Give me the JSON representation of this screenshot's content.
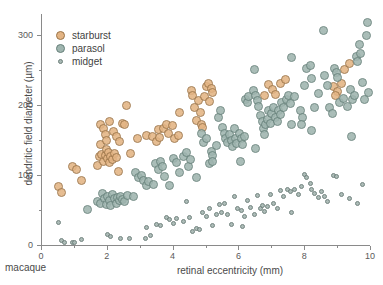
{
  "chart_data": {
    "type": "scatter",
    "title": "",
    "xlabel": "retinal eccentricity (mm)",
    "ylabel": "dendritic field diameter (µm)",
    "corner_label": "macaque",
    "xlim": [
      0,
      10
    ],
    "ylim": [
      0,
      330
    ],
    "xticks": [
      0,
      2,
      4,
      6,
      8,
      10
    ],
    "xticklabels": [
      "0",
      "2",
      "4",
      "6",
      "8",
      "10"
    ],
    "xticks_minor": [
      1,
      3,
      5,
      7,
      9
    ],
    "yticks": [
      0,
      100,
      200,
      300
    ],
    "yticklabels": [
      "0",
      "100",
      "200",
      "300"
    ],
    "yticks_minor": [
      50,
      150,
      250
    ],
    "grid": false,
    "legend_position": "upper left",
    "colors": {
      "starburst_fill": "#e3b484",
      "starburst_edge": "#9a7448",
      "parasol_fill": "#9fb5af",
      "parasol_edge": "#66807a",
      "midget_fill": "#a8b8b4",
      "midget_edge": "#6c7f7a",
      "axis": "#8a8a8a",
      "text": "#4a4a4a"
    },
    "marker_sizes": {
      "starburst": 9,
      "parasol": 9,
      "midget": 5
    },
    "series": [
      {
        "name": "starburst",
        "marker_size": 9,
        "points": [
          [
            0.52,
            83
          ],
          [
            0.62,
            75
          ],
          [
            0.95,
            112
          ],
          [
            1.08,
            108
          ],
          [
            1.22,
            92
          ],
          [
            1.72,
            113
          ],
          [
            1.78,
            126
          ],
          [
            1.8,
            143
          ],
          [
            1.85,
            130
          ],
          [
            1.9,
            120
          ],
          [
            1.95,
            128
          ],
          [
            1.98,
            136
          ],
          [
            2.02,
            124
          ],
          [
            2.05,
            132
          ],
          [
            2.08,
            118
          ],
          [
            2.12,
            127
          ],
          [
            2.18,
            122
          ],
          [
            2.22,
            131
          ],
          [
            2.28,
            125
          ],
          [
            2.35,
            105
          ],
          [
            1.82,
            172
          ],
          [
            1.9,
            166
          ],
          [
            1.95,
            158
          ],
          [
            2.0,
            150
          ],
          [
            2.08,
            176
          ],
          [
            2.2,
            162
          ],
          [
            2.3,
            155
          ],
          [
            2.38,
            148
          ],
          [
            2.48,
            173
          ],
          [
            2.55,
            172
          ],
          [
            2.6,
            199
          ],
          [
            2.72,
            131
          ],
          [
            2.92,
            152
          ],
          [
            3.22,
            157
          ],
          [
            3.38,
            155
          ],
          [
            3.5,
            148
          ],
          [
            3.58,
            165
          ],
          [
            3.6,
            153
          ],
          [
            3.72,
            166
          ],
          [
            3.82,
            172
          ],
          [
            3.88,
            160
          ],
          [
            4.0,
            171
          ],
          [
            4.05,
            152
          ],
          [
            4.18,
            157
          ],
          [
            4.22,
            190
          ],
          [
            4.58,
            221
          ],
          [
            4.62,
            213
          ],
          [
            4.68,
            196
          ],
          [
            4.72,
            178
          ],
          [
            4.8,
            206
          ],
          [
            4.85,
            190
          ],
          [
            4.88,
            172
          ],
          [
            4.92,
            168
          ],
          [
            4.98,
            212
          ],
          [
            5.02,
            226
          ],
          [
            5.08,
            231
          ],
          [
            5.12,
            205
          ],
          [
            5.18,
            224
          ],
          [
            5.22,
            218
          ],
          [
            6.78,
            213
          ],
          [
            6.92,
            230
          ],
          [
            7.05,
            222
          ],
          [
            7.12,
            215
          ],
          [
            7.28,
            231
          ],
          [
            7.42,
            237
          ],
          [
            8.88,
            226
          ],
          [
            9.02,
            219
          ],
          [
            9.12,
            231
          ],
          [
            9.22,
            251
          ],
          [
            9.38,
            259
          ],
          [
            8.95,
            214
          ]
        ]
      },
      {
        "name": "parasol",
        "marker_size": 9,
        "points": [
          [
            1.42,
            51
          ],
          [
            1.72,
            62
          ],
          [
            1.8,
            60
          ],
          [
            1.88,
            73
          ],
          [
            1.92,
            66
          ],
          [
            1.98,
            58
          ],
          [
            2.02,
            70
          ],
          [
            2.08,
            64
          ],
          [
            2.12,
            57
          ],
          [
            2.18,
            72
          ],
          [
            2.22,
            66
          ],
          [
            2.28,
            60
          ],
          [
            2.32,
            68
          ],
          [
            2.38,
            63
          ],
          [
            2.42,
            70
          ],
          [
            2.48,
            65
          ],
          [
            2.55,
            62
          ],
          [
            2.62,
            71
          ],
          [
            2.82,
            70
          ],
          [
            2.88,
            104
          ],
          [
            2.95,
            96
          ],
          [
            3.05,
            100
          ],
          [
            3.12,
            92
          ],
          [
            3.22,
            85
          ],
          [
            3.28,
            91
          ],
          [
            3.42,
            86
          ],
          [
            3.48,
            116
          ],
          [
            3.58,
            108
          ],
          [
            3.62,
            120
          ],
          [
            3.68,
            112
          ],
          [
            3.75,
            98
          ],
          [
            3.92,
            85
          ],
          [
            4.02,
            124
          ],
          [
            4.12,
            118
          ],
          [
            4.22,
            104
          ],
          [
            4.32,
            127
          ],
          [
            4.42,
            132
          ],
          [
            4.48,
            112
          ],
          [
            4.55,
            122
          ],
          [
            4.72,
            97
          ],
          [
            4.88,
            160
          ],
          [
            4.95,
            147
          ],
          [
            5.02,
            152
          ],
          [
            5.12,
            116
          ],
          [
            5.18,
            133
          ],
          [
            5.22,
            128
          ],
          [
            5.32,
            142
          ],
          [
            5.38,
            182
          ],
          [
            5.45,
            192
          ],
          [
            5.52,
            168
          ],
          [
            5.58,
            160
          ],
          [
            5.62,
            152
          ],
          [
            5.68,
            146
          ],
          [
            5.72,
            158
          ],
          [
            5.78,
            150
          ],
          [
            5.82,
            141
          ],
          [
            5.88,
            166
          ],
          [
            5.92,
            152
          ],
          [
            5.95,
            145
          ],
          [
            6.02,
            160
          ],
          [
            6.08,
            152
          ],
          [
            6.12,
            143
          ],
          [
            6.18,
            155
          ],
          [
            6.22,
            208
          ],
          [
            6.28,
            204
          ],
          [
            6.32,
            212
          ],
          [
            6.45,
            221
          ],
          [
            6.52,
            214
          ],
          [
            6.58,
            206
          ],
          [
            6.62,
            198
          ],
          [
            6.68,
            185
          ],
          [
            6.72,
            176
          ],
          [
            6.75,
            167
          ],
          [
            6.8,
            158
          ],
          [
            6.82,
            172
          ],
          [
            6.88,
            180
          ],
          [
            6.92,
            192
          ],
          [
            6.98,
            174
          ],
          [
            7.02,
            188
          ],
          [
            7.08,
            196
          ],
          [
            7.12,
            182
          ],
          [
            7.18,
            176
          ],
          [
            7.22,
            192
          ],
          [
            7.28,
            186
          ],
          [
            7.32,
            203
          ],
          [
            7.38,
            196
          ],
          [
            7.45,
            208
          ],
          [
            7.52,
            214
          ],
          [
            7.58,
            202
          ],
          [
            7.62,
            172
          ],
          [
            6.48,
            251
          ],
          [
            6.52,
            138
          ],
          [
            7.62,
            268
          ],
          [
            7.72,
            212
          ],
          [
            7.88,
            192
          ],
          [
            7.95,
            182
          ],
          [
            8.02,
            228
          ],
          [
            8.08,
            252
          ],
          [
            8.18,
            256
          ],
          [
            8.22,
            238
          ],
          [
            8.32,
            196
          ],
          [
            8.42,
            216
          ],
          [
            8.58,
            306
          ],
          [
            8.62,
            242
          ],
          [
            8.72,
            228
          ],
          [
            8.78,
            196
          ],
          [
            8.85,
            188
          ],
          [
            8.92,
            252
          ],
          [
            8.98,
            246
          ],
          [
            9.02,
            240
          ],
          [
            9.08,
            204
          ],
          [
            9.18,
            210
          ],
          [
            9.32,
            198
          ],
          [
            9.42,
            222
          ],
          [
            9.48,
            208
          ],
          [
            9.52,
            214
          ],
          [
            9.58,
            270
          ],
          [
            9.62,
            262
          ],
          [
            9.68,
            286
          ],
          [
            9.72,
            274
          ],
          [
            9.78,
            232
          ],
          [
            9.82,
            208
          ],
          [
            9.88,
            300
          ],
          [
            9.92,
            318
          ],
          [
            9.95,
            218
          ],
          [
            9.45,
            155
          ],
          [
            8.22,
            163
          ],
          [
            7.92,
            172
          ],
          [
            6.05,
            120
          ],
          [
            5.22,
            120
          ]
        ]
      },
      {
        "name": "midget",
        "marker_size": 5,
        "points": [
          [
            0.52,
            32
          ],
          [
            0.62,
            6
          ],
          [
            0.72,
            4
          ],
          [
            0.95,
            3
          ],
          [
            1.02,
            4
          ],
          [
            1.22,
            8
          ],
          [
            2.02,
            15
          ],
          [
            2.12,
            12
          ],
          [
            2.42,
            9
          ],
          [
            2.68,
            10
          ],
          [
            3.18,
            10
          ],
          [
            3.22,
            25
          ],
          [
            3.32,
            13
          ],
          [
            3.52,
            30
          ],
          [
            3.62,
            28
          ],
          [
            3.82,
            40
          ],
          [
            3.92,
            36
          ],
          [
            4.02,
            31
          ],
          [
            4.12,
            38
          ],
          [
            4.32,
            34
          ],
          [
            4.42,
            62
          ],
          [
            4.52,
            39
          ],
          [
            4.72,
            24
          ],
          [
            4.82,
            22
          ],
          [
            4.92,
            46
          ],
          [
            5.02,
            41
          ],
          [
            5.12,
            52
          ],
          [
            5.22,
            28
          ],
          [
            5.32,
            44
          ],
          [
            5.42,
            58
          ],
          [
            5.48,
            47
          ],
          [
            5.58,
            60
          ],
          [
            5.68,
            44
          ],
          [
            5.78,
            30
          ],
          [
            5.88,
            70
          ],
          [
            5.98,
            52
          ],
          [
            6.08,
            50
          ],
          [
            6.18,
            41
          ],
          [
            6.28,
            63
          ],
          [
            6.38,
            53
          ],
          [
            6.48,
            44
          ],
          [
            6.58,
            71
          ],
          [
            6.68,
            52
          ],
          [
            6.72,
            56
          ],
          [
            6.78,
            48
          ],
          [
            6.88,
            55
          ],
          [
            6.98,
            72
          ],
          [
            7.08,
            60
          ],
          [
            7.18,
            52
          ],
          [
            7.28,
            78
          ],
          [
            7.38,
            70
          ],
          [
            7.48,
            79
          ],
          [
            7.58,
            76
          ],
          [
            7.62,
            46
          ],
          [
            7.72,
            80
          ],
          [
            7.82,
            72
          ],
          [
            7.92,
            84
          ],
          [
            8.02,
            101
          ],
          [
            8.08,
            96
          ],
          [
            8.18,
            88
          ],
          [
            8.22,
            80
          ],
          [
            8.32,
            74
          ],
          [
            8.42,
            68
          ],
          [
            8.52,
            76
          ],
          [
            8.62,
            70
          ],
          [
            8.72,
            62
          ],
          [
            8.88,
            100
          ],
          [
            8.98,
            98
          ],
          [
            9.12,
            72
          ],
          [
            9.38,
            67
          ],
          [
            9.62,
            60
          ],
          [
            9.78,
            86
          ],
          [
            6.12,
            26
          ],
          [
            4.62,
            19
          ]
        ]
      }
    ]
  },
  "legend": {
    "items": [
      {
        "label": "starburst",
        "series": "starburst"
      },
      {
        "label": "parasol",
        "series": "parasol"
      },
      {
        "label": "midget",
        "series": "midget"
      }
    ]
  }
}
